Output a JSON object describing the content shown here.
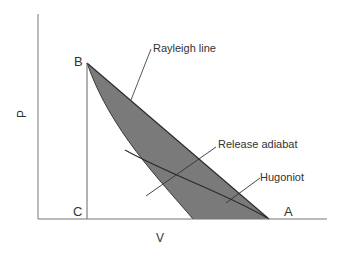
{
  "diagram": {
    "axes": {
      "x_label": "V",
      "y_label": "P"
    },
    "points": {
      "B": "B",
      "C": "C",
      "A": "A"
    },
    "annotations": {
      "rayleigh": "Rayleigh line",
      "release": "Release adiabat",
      "hugoniot": "Hugoniot"
    },
    "colors": {
      "fill": "#7a7a7a",
      "stroke": "#333333",
      "axis": "#555555",
      "text": "#333333"
    }
  }
}
